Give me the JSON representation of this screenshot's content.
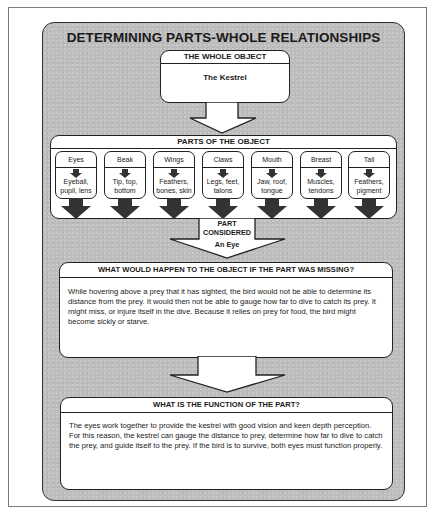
{
  "title": "DETERMINING PARTS-WHOLE RELATIONSHIPS",
  "whole_object": {
    "header": "THE WHOLE OBJECT",
    "value": "The Kestrel"
  },
  "parts_of_object": {
    "header": "PARTS OF THE OBJECT",
    "parts": [
      {
        "name": "Eyes",
        "subparts": "Eyeball, pupil, lens"
      },
      {
        "name": "Beak",
        "subparts": "Tip, top, bottom"
      },
      {
        "name": "Wings",
        "subparts": "Feathers, bones, skin"
      },
      {
        "name": "Claws",
        "subparts": "Legs, feet, talons"
      },
      {
        "name": "Mouth",
        "subparts": "Jaw, roof, tongue"
      },
      {
        "name": "Breast",
        "subparts": "Muscles, tendons"
      },
      {
        "name": "Tail",
        "subparts": "Feathers, pigment"
      }
    ]
  },
  "part_considered": {
    "label_line1": "PART",
    "label_line2": "CONSIDERED",
    "value": "An Eye"
  },
  "missing_question": {
    "header": "WHAT WOULD HAPPEN TO THE OBJECT IF THE PART WAS MISSING?",
    "answer": "While hovering above a prey that it has sighted, the bird would not be able to determine its distance from the prey. It would then not be able to gauge how far to dive to catch its prey. It might miss, or injure itself in the dive. Because it relies on prey for food, the bird might become sickly or starve."
  },
  "function_question": {
    "header": "WHAT IS THE FUNCTION OF THE PART?",
    "answer": "The eyes work together to provide the kestrel with good vision and keen depth perception. For this reason, the kestrel can gauge the distance to prey, determine how far to dive to catch the prey, and guide itself to the prey. If the bird is to survive, both eyes must function properly."
  },
  "colors": {
    "panel": "#bdbdbd",
    "box": "#ffffff",
    "stroke": "#222222",
    "arrow_fill": "#333333"
  }
}
